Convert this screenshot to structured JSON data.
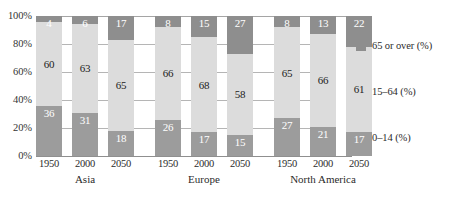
{
  "chart_data": {
    "type": "bar",
    "subtype": "stacked-100-percent-column",
    "title": "",
    "xlabel": "",
    "ylabel": "",
    "ylim": [
      0,
      100
    ],
    "ytick_labels": [
      "100%",
      "80%",
      "60%",
      "40%",
      "20%",
      "0%"
    ],
    "ytick_values": [
      100,
      80,
      60,
      40,
      20,
      0
    ],
    "grid": true,
    "legend_position": "right",
    "categories": [
      "1950",
      "2000",
      "2050",
      "1950",
      "2000",
      "2050",
      "1950",
      "2000",
      "2050"
    ],
    "groups": [
      {
        "name": "Asia",
        "years": [
          "1950",
          "2000",
          "2050"
        ]
      },
      {
        "name": "Europe",
        "years": [
          "1950",
          "2000",
          "2050"
        ]
      },
      {
        "name": "North America",
        "years": [
          "1950",
          "2000",
          "2050"
        ]
      }
    ],
    "series": [
      {
        "name": "65 or over (%)",
        "color": "#8e8e8e",
        "values": [
          4,
          6,
          17,
          8,
          15,
          27,
          8,
          13,
          22
        ]
      },
      {
        "name": "15-64 (%)",
        "color": "#dcdcdc",
        "values": [
          60,
          63,
          65,
          66,
          68,
          58,
          65,
          66,
          61
        ]
      },
      {
        "name": "0-14 (%)",
        "color": "#9c9c9c",
        "values": [
          36,
          31,
          18,
          26,
          17,
          15,
          27,
          21,
          17
        ]
      }
    ],
    "bars": [
      {
        "group": "Asia",
        "year": "1950",
        "top": 4,
        "mid": 60,
        "bottom": 36
      },
      {
        "group": "Asia",
        "year": "2000",
        "top": 6,
        "mid": 63,
        "bottom": 31
      },
      {
        "group": "Asia",
        "year": "2050",
        "top": 17,
        "mid": 65,
        "bottom": 18
      },
      {
        "group": "Europe",
        "year": "1950",
        "top": 8,
        "mid": 66,
        "bottom": 26
      },
      {
        "group": "Europe",
        "year": "2000",
        "top": 15,
        "mid": 68,
        "bottom": 17
      },
      {
        "group": "Europe",
        "year": "2050",
        "top": 27,
        "mid": 58,
        "bottom": 15
      },
      {
        "group": "North America",
        "year": "1950",
        "top": 8,
        "mid": 65,
        "bottom": 27
      },
      {
        "group": "North America",
        "year": "2000",
        "top": 13,
        "mid": 66,
        "bottom": 21
      },
      {
        "group": "North America",
        "year": "2050",
        "top": 22,
        "mid": 61,
        "bottom": 17
      }
    ],
    "legend": [
      {
        "label": "65 or over (%)",
        "color": "#8e8e8e"
      },
      {
        "label": "15–64 (%)",
        "color": "#dcdcdc"
      },
      {
        "label": "0–14 (%)",
        "color": "#9c9c9c"
      }
    ]
  },
  "axis": {
    "y_labels": [
      "100%",
      "80%",
      "60%",
      "40%",
      "20%",
      "0%"
    ]
  },
  "x_axis": {
    "years": [
      "1950",
      "2000",
      "2050",
      "1950",
      "2000",
      "2050",
      "1950",
      "2000",
      "2050"
    ],
    "group_names": [
      "Asia",
      "Europe",
      "North America"
    ]
  }
}
